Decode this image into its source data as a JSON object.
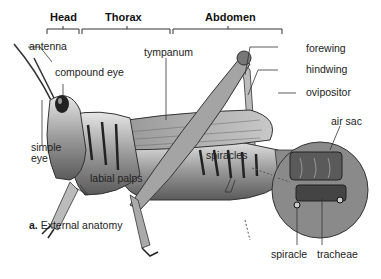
{
  "figure": {
    "caption_letter": "a.",
    "caption_text": "External anatomy"
  },
  "regions": [
    {
      "label": "Head",
      "x": 63,
      "span": [
        47,
        79
      ]
    },
    {
      "label": "Thorax",
      "x": 127,
      "span": [
        82,
        170
      ]
    },
    {
      "label": "Abdomen",
      "x": 228,
      "span": [
        173,
        282
      ]
    }
  ],
  "labels": {
    "antenna": "antenna",
    "compound_eye": "compound eye",
    "simple_eye_1": "simple",
    "simple_eye_2": "eye",
    "labial_palps": "labial palps",
    "tympanum": "tympanum",
    "forewing": "forewing",
    "hindwing": "hindwing",
    "ovipositor": "ovipositor",
    "spiracles": "spiracles",
    "air_sac": "air sac",
    "spiracle": "spiracle",
    "tracheae": "tracheae"
  },
  "colors": {
    "body_dark": "#2a2a2a",
    "body_mid": "#8a8a8a",
    "body_light": "#d9d9d9",
    "line": "#333333"
  }
}
